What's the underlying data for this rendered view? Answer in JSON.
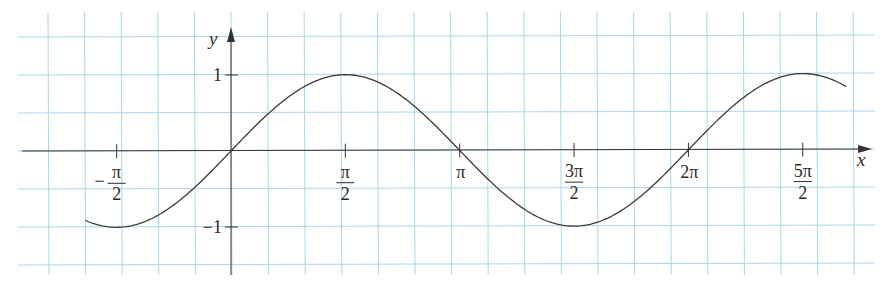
{
  "chart_data": {
    "type": "line",
    "title": "",
    "function": "y = sin x",
    "xlabel": "x",
    "ylabel": "y",
    "xlim": [
      -2.0,
      8.6
    ],
    "ylim": [
      -1.55,
      1.55
    ],
    "grid": true,
    "colors": {
      "grid": "#a9d6e8",
      "axis": "#333333",
      "curve": "#3a3a3a",
      "background": "#ffffff"
    },
    "x_ticks": [
      {
        "value": -1.5708,
        "sign": "−",
        "numerator": "π",
        "denominator": "2",
        "label": "−π/2"
      },
      {
        "value": 1.5708,
        "sign": "",
        "numerator": "π",
        "denominator": "2",
        "label": "π/2"
      },
      {
        "value": 3.1416,
        "sign": "",
        "numerator": "π",
        "denominator": "",
        "label": "π"
      },
      {
        "value": 4.7124,
        "sign": "",
        "numerator": "3π",
        "denominator": "2",
        "label": "3π/2"
      },
      {
        "value": 6.2832,
        "sign": "",
        "numerator": "2π",
        "denominator": "",
        "label": "2π"
      },
      {
        "value": 7.854,
        "sign": "",
        "numerator": "5π",
        "denominator": "2",
        "label": "5π/2"
      }
    ],
    "y_ticks": [
      {
        "value": 1,
        "label": "1"
      },
      {
        "value": -1,
        "label": "−1"
      }
    ],
    "series": [
      {
        "name": "sin x",
        "x_start": -2.0,
        "x_end": 8.45,
        "points": [
          [
            -2.0,
            -0.909
          ],
          [
            -1.5708,
            -1.0
          ],
          [
            -1.0,
            -0.841
          ],
          [
            -0.5,
            -0.479
          ],
          [
            0.0,
            0.0
          ],
          [
            0.5,
            0.479
          ],
          [
            1.0,
            0.841
          ],
          [
            1.5708,
            1.0
          ],
          [
            2.0,
            0.909
          ],
          [
            2.5,
            0.598
          ],
          [
            3.1416,
            0.0
          ],
          [
            3.5,
            -0.351
          ],
          [
            4.0,
            -0.757
          ],
          [
            4.7124,
            -1.0
          ],
          [
            5.5,
            -0.706
          ],
          [
            6.2832,
            0.0
          ],
          [
            7.0,
            0.657
          ],
          [
            7.854,
            1.0
          ],
          [
            8.45,
            0.811
          ]
        ]
      }
    ]
  }
}
